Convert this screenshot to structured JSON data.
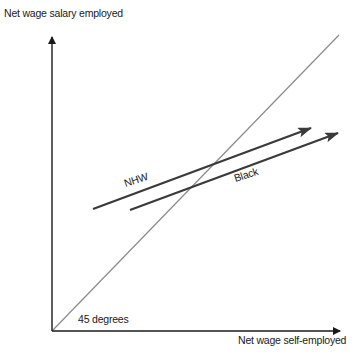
{
  "diagram": {
    "y_axis": {
      "label": "Net wage salary employed"
    },
    "x_axis": {
      "label": "Net wage self-employed"
    },
    "reference_line": {
      "label": "45 degrees",
      "color": "#8a8a8a"
    },
    "series": [
      {
        "name": "NHW",
        "label": "NHW",
        "color": "#3a3a3a"
      },
      {
        "name": "Black",
        "label": "Black",
        "color": "#3a3a3a"
      }
    ],
    "axis_color": "#1a1a1a"
  }
}
